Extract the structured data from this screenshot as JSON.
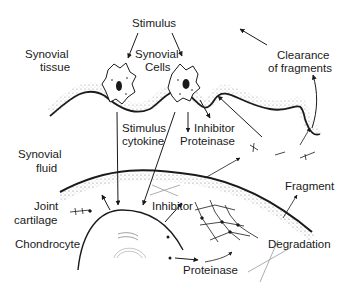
{
  "diagram": {
    "labels": {
      "stimulus_top": "Stimulus",
      "synovial_tissue_1": "Synovial",
      "synovial_tissue_2": "tissue",
      "synovial_cells_1": "Synovial",
      "synovial_cells_2": "Cells",
      "clearance_1": "Clearance",
      "clearance_2": "of fragments",
      "stimulus_cytokine_1": "Stimulus",
      "stimulus_cytokine_2": "cytokine",
      "inhibitor_top": "Inhibitor",
      "proteinase_top": "Proteinase",
      "synovial_fluid_1": "Synovial",
      "synovial_fluid_2": "fluid",
      "fragment": "Fragment",
      "joint_cartilage_1": "Joint",
      "joint_cartilage_2": "cartilage",
      "inhibitor_bottom": "Inhibitor",
      "chondrocyte": "Chondrocyte",
      "degradation": "Degradation",
      "proteinase_bottom": "Proteinase"
    },
    "colors": {
      "ink": "#1a1a1a",
      "stipple": "#8a8a8a",
      "background": "#ffffff"
    }
  }
}
